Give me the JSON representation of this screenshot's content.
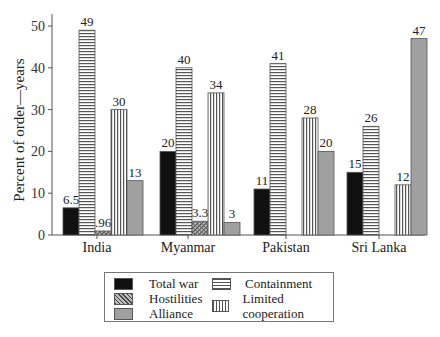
{
  "chart_data": {
    "type": "bar",
    "title": "",
    "xlabel": "",
    "ylabel": "Percent of order—years",
    "ylim": [
      0,
      50
    ],
    "yticks": [
      0,
      10,
      20,
      30,
      40,
      50
    ],
    "grid": false,
    "legend_position": "bottom",
    "categories": [
      "India",
      "Myanmar",
      "Pakistan",
      "Sri Lanka"
    ],
    "series": [
      {
        "name": "Total war",
        "pattern": "solid-black",
        "values": [
          6.5,
          20,
          11,
          15
        ],
        "labels": [
          "6.5",
          "20",
          "11",
          "15"
        ]
      },
      {
        "name": "Containment",
        "pattern": "horizontal-lines",
        "values": [
          49,
          40,
          41,
          26
        ],
        "labels": [
          "49",
          "40",
          "41",
          "26"
        ]
      },
      {
        "name": "Hostilities",
        "pattern": "crosshatch",
        "values": [
          0.96,
          3.3,
          null,
          null
        ],
        "labels": [
          ".96",
          "3.3",
          "",
          ""
        ]
      },
      {
        "name": "Limited cooperation",
        "pattern": "vertical-lines",
        "values": [
          30,
          34,
          28,
          12
        ],
        "labels": [
          "30",
          "34",
          "28",
          "12"
        ]
      },
      {
        "name": "Alliance",
        "pattern": "solid-gray",
        "values": [
          13,
          3,
          20,
          47
        ],
        "labels": [
          "13",
          "3",
          "20",
          "47"
        ]
      }
    ]
  },
  "legend": {
    "items": [
      {
        "label": "Total war"
      },
      {
        "label": "Hostilities"
      },
      {
        "label": "Alliance"
      },
      {
        "label": "Containment"
      },
      {
        "label": "Limited cooperation"
      }
    ]
  },
  "colors": {
    "total_war": "#111111",
    "alliance": "#a0a0a0",
    "axis": "#555555"
  }
}
